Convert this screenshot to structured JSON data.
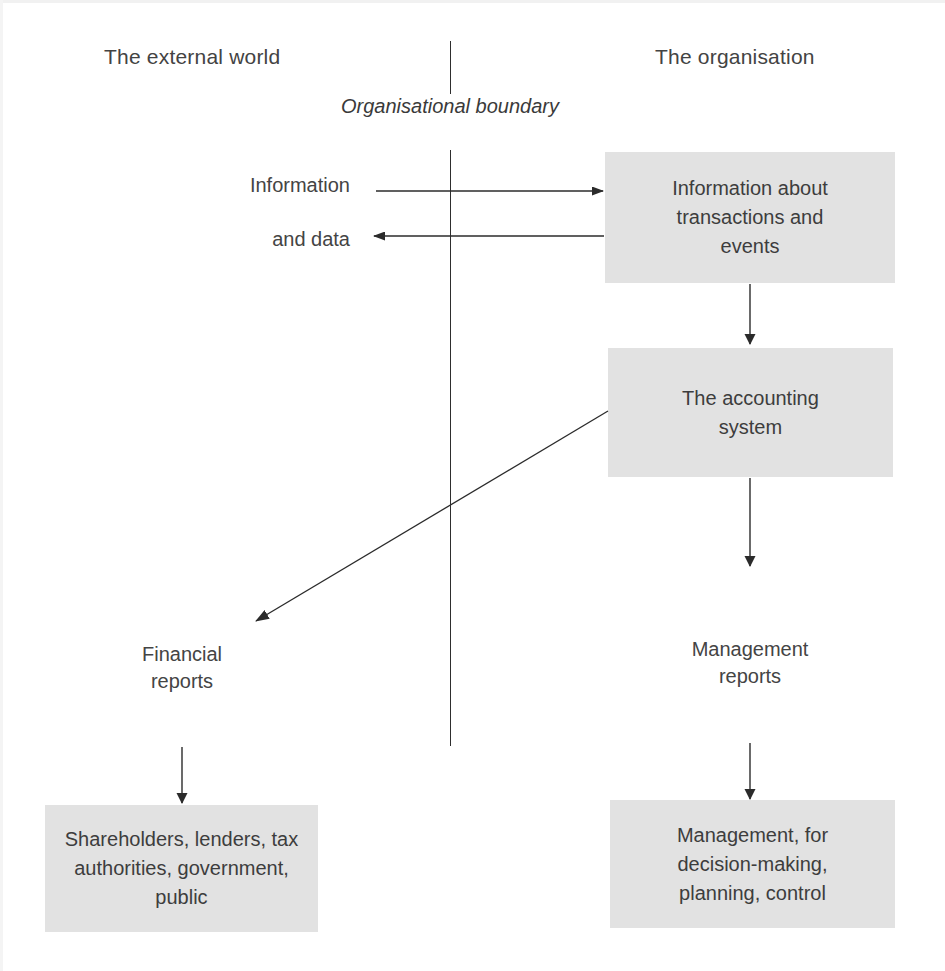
{
  "diagram": {
    "background_color": "#ffffff",
    "box_fill_color": "#e2e2e2",
    "line_color": "#2e2e2e",
    "text_color": "#3d3d3d"
  },
  "regions": {
    "external": "The external world",
    "organisation": "The organisation"
  },
  "boundary": {
    "caption": "Organisational\nboundary"
  },
  "edge_labels": {
    "information": "Information",
    "and_data": "and data",
    "financial_reports": "Financial\nreports",
    "management_reports": "Management\nreports"
  },
  "boxes": {
    "information_about": "Information about\ntransactions and\nevents",
    "accounting_system": "The accounting\nsystem",
    "external_users": "Shareholders, lenders, tax\nauthorities, government,\npublic",
    "management_users": "Management, for\ndecision-making,\nplanning, control"
  },
  "arrows": [
    {
      "name": "information-in-arrow",
      "from": "external world",
      "to": "Information about transactions and events",
      "direction": "right"
    },
    {
      "name": "data-out-arrow",
      "from": "Information about transactions and events",
      "to": "external world",
      "direction": "left"
    },
    {
      "name": "information-to-accounting-arrow",
      "from": "Information about transactions and events",
      "to": "The accounting system",
      "direction": "down"
    },
    {
      "name": "accounting-to-management-reports-arrow",
      "from": "The accounting system",
      "to": "Management reports",
      "direction": "down"
    },
    {
      "name": "accounting-to-financial-reports-arrow",
      "from": "The accounting system",
      "to": "Financial reports",
      "direction": "diagonal-down-left"
    },
    {
      "name": "financial-reports-to-external-users-arrow",
      "from": "Financial reports",
      "to": "Shareholders, lenders, tax authorities, government, public",
      "direction": "down"
    },
    {
      "name": "management-reports-to-management-arrow",
      "from": "Management reports",
      "to": "Management, for decision-making, planning, control",
      "direction": "down"
    }
  ]
}
